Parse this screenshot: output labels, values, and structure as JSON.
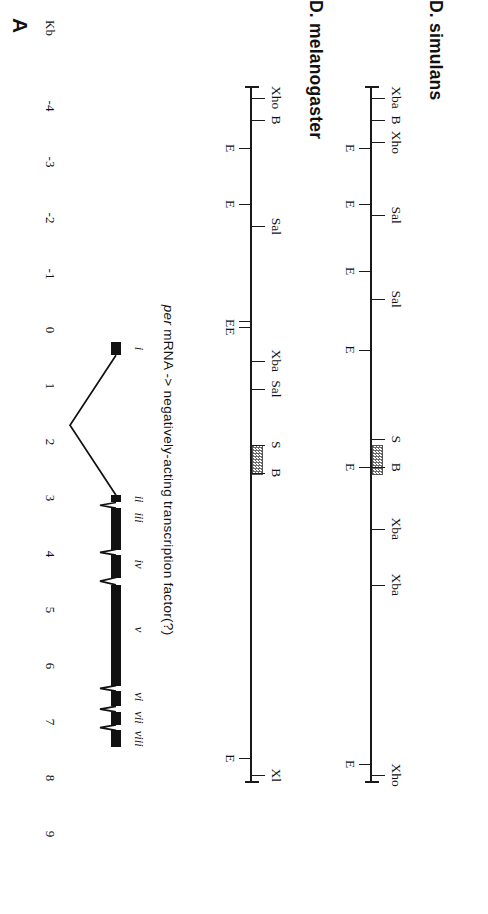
{
  "figure": {
    "panel_label": "A",
    "axis": {
      "title": "Kb",
      "ticks": [
        "-4",
        "-3",
        "-2",
        "-1",
        "0",
        "1",
        "2",
        "3",
        "4",
        "5",
        "6",
        "7",
        "8",
        "9"
      ],
      "min": -4,
      "max": 9
    }
  },
  "simulans": {
    "title": "D. simulans",
    "sites_above": [
      {
        "label": "Xba",
        "kb": -4.15
      },
      {
        "label": "B",
        "kb": -3.75
      },
      {
        "label": "Xho",
        "kb": -3.35
      },
      {
        "label": "B",
        "kb": 2.45
      },
      {
        "label": "Xba",
        "kb": 3.55
      },
      {
        "label": "Xba",
        "kb": 4.55
      },
      {
        "label": "Xho",
        "kb": 7.95
      },
      {
        "label": "S",
        "kb": 1.95
      },
      {
        "label": "Sal",
        "kb": -0.55
      },
      {
        "label": "Sal",
        "kb": -2.05
      }
    ],
    "sites_below": [
      {
        "label": "E",
        "kb": -3.25
      },
      {
        "label": "E",
        "kb": -2.25
      },
      {
        "label": "E",
        "kb": -1.05
      },
      {
        "label": "E",
        "kb": 0.35
      },
      {
        "label": "E",
        "kb": 2.45
      },
      {
        "label": "E",
        "kb": 7.75
      }
    ],
    "hatch_box": {
      "start_kb": 2.05,
      "end_kb": 2.55
    }
  },
  "melanogaster": {
    "title": "D. melanogaster",
    "sites_above": [
      {
        "label": "Xho",
        "kb": -4.15
      },
      {
        "label": "B",
        "kb": -3.75
      },
      {
        "label": "Sal",
        "kb": -1.85
      },
      {
        "label": "Xba",
        "kb": 0.55
      },
      {
        "label": "Sal",
        "kb": 1.05
      },
      {
        "label": "S",
        "kb": 2.05
      },
      {
        "label": "B",
        "kb": 2.55
      },
      {
        "label": "Xl",
        "kb": 7.95
      }
    ],
    "sites_below": [
      {
        "label": "E",
        "kb": -3.25
      },
      {
        "label": "E",
        "kb": -2.25
      },
      {
        "label": "EE",
        "kb": -0.05
      },
      {
        "label": "E",
        "kb": 7.65
      }
    ],
    "hatch_box": {
      "start_kb": 2.05,
      "end_kb": 2.55
    }
  },
  "gene_model": {
    "caption_prefix": "per",
    "caption_rest": " mRNA  ->  negatively-acting  transcription  factor(?)",
    "exons": [
      {
        "name": "i",
        "start_kb": 0.22,
        "end_kb": 0.45
      },
      {
        "name": "ii",
        "start_kb": 2.95,
        "end_kb": 3.08
      },
      {
        "name": "iii",
        "start_kb": 3.18,
        "end_kb": 3.92
      },
      {
        "name": "iv",
        "start_kb": 4.02,
        "end_kb": 4.42
      },
      {
        "name": "v",
        "start_kb": 4.55,
        "end_kb": 6.35
      },
      {
        "name": "vi",
        "start_kb": 6.45,
        "end_kb": 6.72
      },
      {
        "name": "vii",
        "start_kb": 6.82,
        "end_kb": 7.05
      },
      {
        "name": "viii",
        "start_kb": 7.15,
        "end_kb": 7.45
      }
    ],
    "exon_labels": [
      {
        "name": "i",
        "kb": 0.33
      },
      {
        "name": "ii",
        "kb": 3.02
      },
      {
        "name": "iii",
        "kb": 3.35
      },
      {
        "name": "iv",
        "kb": 4.18
      },
      {
        "name": "v",
        "kb": 5.35
      },
      {
        "name": "vi",
        "kb": 6.55
      },
      {
        "name": "vii",
        "kb": 6.92
      },
      {
        "name": "viii",
        "kb": 7.3
      }
    ]
  },
  "colors": {
    "ink": "#111111",
    "hatch": "#6b6b6b",
    "background": "#ffffff"
  }
}
